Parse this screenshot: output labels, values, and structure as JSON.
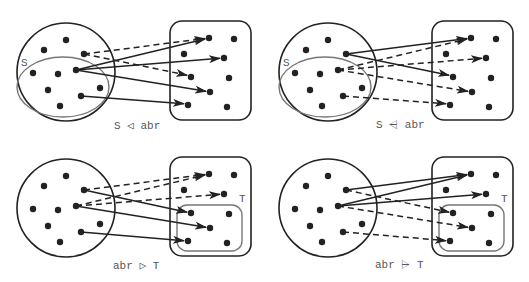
{
  "colors": {
    "stroke": "#222222",
    "subset": "#777777",
    "text": "#555555",
    "background": "#ffffff"
  },
  "panels": [
    {
      "id": "domain-restriction",
      "caption": "S ◁ abr",
      "caption_pos": [
        114,
        130
      ],
      "offset": [
        0,
        0
      ],
      "set_label": "S",
      "set_label_pos": [
        21,
        66
      ],
      "subset": {
        "type": "ellipse",
        "cx": 63,
        "cy": 87,
        "rx": 46,
        "ry": 30
      },
      "edges": [
        {
          "from": [
            84,
            54
          ],
          "to": [
            209,
            38
          ],
          "style": "dashed"
        },
        {
          "from": [
            84,
            54
          ],
          "to": [
            191,
            76
          ],
          "style": "dashed"
        },
        {
          "from": [
            76,
            70
          ],
          "to": [
            209,
            38
          ],
          "style": "solid"
        },
        {
          "from": [
            76,
            70
          ],
          "to": [
            224,
            58
          ],
          "style": "solid"
        },
        {
          "from": [
            76,
            70
          ],
          "to": [
            210,
            92
          ],
          "style": "solid"
        },
        {
          "from": [
            81,
            96
          ],
          "to": [
            188,
            104
          ],
          "style": "solid"
        }
      ]
    },
    {
      "id": "domain-subtraction",
      "caption": "S ⩤ abr",
      "caption_pos": [
        376,
        130
      ],
      "offset": [
        262,
        0
      ],
      "set_label": "S",
      "set_label_pos": [
        21,
        66
      ],
      "subset": {
        "type": "ellipse",
        "cx": 63,
        "cy": 87,
        "rx": 46,
        "ry": 30
      },
      "edges": [
        {
          "from": [
            84,
            54
          ],
          "to": [
            209,
            38
          ],
          "style": "solid"
        },
        {
          "from": [
            84,
            54
          ],
          "to": [
            191,
            76
          ],
          "style": "solid"
        },
        {
          "from": [
            76,
            70
          ],
          "to": [
            209,
            38
          ],
          "style": "dashed"
        },
        {
          "from": [
            76,
            70
          ],
          "to": [
            224,
            58
          ],
          "style": "dashed"
        },
        {
          "from": [
            76,
            70
          ],
          "to": [
            210,
            92
          ],
          "style": "dashed"
        },
        {
          "from": [
            81,
            96
          ],
          "to": [
            188,
            104
          ],
          "style": "dashed"
        }
      ]
    },
    {
      "id": "range-restriction",
      "caption": "abr ▷ T",
      "caption_pos": [
        113,
        270
      ],
      "offset": [
        0,
        136
      ],
      "set_label": "T",
      "set_label_pos": [
        239,
        66
      ],
      "subset": {
        "type": "rect",
        "x": 177,
        "y": 69,
        "w": 65,
        "h": 46,
        "r": 10
      },
      "edges": [
        {
          "from": [
            84,
            54
          ],
          "to": [
            209,
            38
          ],
          "style": "dashed"
        },
        {
          "from": [
            84,
            54
          ],
          "to": [
            191,
            77
          ],
          "style": "solid"
        },
        {
          "from": [
            76,
            70
          ],
          "to": [
            209,
            38
          ],
          "style": "dashed"
        },
        {
          "from": [
            76,
            70
          ],
          "to": [
            224,
            58
          ],
          "style": "dashed"
        },
        {
          "from": [
            76,
            70
          ],
          "to": [
            210,
            92
          ],
          "style": "solid"
        },
        {
          "from": [
            81,
            96
          ],
          "to": [
            188,
            105
          ],
          "style": "solid"
        }
      ]
    },
    {
      "id": "range-subtraction",
      "caption": "abr ⩥ T",
      "caption_pos": [
        375,
        270
      ],
      "offset": [
        262,
        136
      ],
      "set_label": "T",
      "set_label_pos": [
        239,
        66
      ],
      "subset": {
        "type": "rect",
        "x": 177,
        "y": 69,
        "w": 65,
        "h": 46,
        "r": 10
      },
      "edges": [
        {
          "from": [
            84,
            54
          ],
          "to": [
            209,
            38
          ],
          "style": "solid"
        },
        {
          "from": [
            84,
            54
          ],
          "to": [
            191,
            77
          ],
          "style": "dashed"
        },
        {
          "from": [
            76,
            70
          ],
          "to": [
            209,
            38
          ],
          "style": "solid"
        },
        {
          "from": [
            76,
            70
          ],
          "to": [
            224,
            58
          ],
          "style": "solid"
        },
        {
          "from": [
            76,
            70
          ],
          "to": [
            210,
            92
          ],
          "style": "dashed"
        },
        {
          "from": [
            81,
            96
          ],
          "to": [
            188,
            105
          ],
          "style": "dashed"
        }
      ]
    }
  ],
  "domain": {
    "circle": {
      "cx": 66,
      "cy": 72,
      "r": 49
    },
    "dots": [
      [
        66,
        40
      ],
      [
        44,
        50
      ],
      [
        84,
        54
      ],
      [
        33,
        73
      ],
      [
        58,
        74
      ],
      [
        76,
        70
      ],
      [
        48,
        90
      ],
      [
        100,
        88
      ],
      [
        81,
        96
      ],
      [
        60,
        106
      ]
    ]
  },
  "range": {
    "box": {
      "x": 170,
      "y": 21,
      "w": 81,
      "h": 99,
      "r": 12
    },
    "dots": [
      [
        209,
        38
      ],
      [
        234,
        39
      ],
      [
        184,
        54
      ],
      [
        224,
        58
      ],
      [
        191,
        77
      ],
      [
        229,
        78
      ],
      [
        210,
        92
      ],
      [
        188,
        105
      ],
      [
        227,
        107
      ]
    ]
  }
}
